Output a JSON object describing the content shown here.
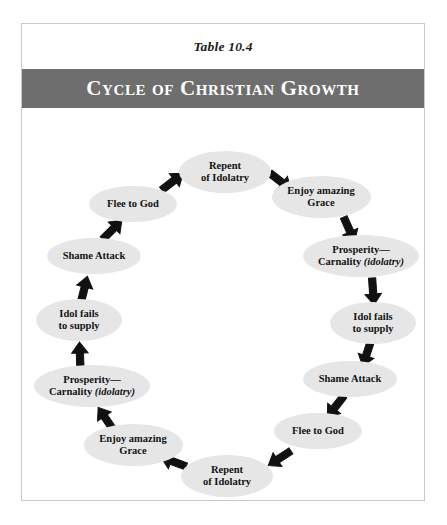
{
  "caption": "Table 10.4",
  "header": {
    "title": "Cycle of Christian Growth",
    "band_color": "#6e6e6e",
    "text_color": "#ffffff"
  },
  "frame": {
    "border_color": "#c9c9c9",
    "background": "#ffffff"
  },
  "diagram": {
    "type": "cycle",
    "direction": "clockwise",
    "node_fill": "#e6e6e6",
    "node_text_color": "#131313",
    "arrow_color": "#111111",
    "node_count": 12,
    "nodes": [
      {
        "id": "repent-of-idolatry-top",
        "line1": "Repent",
        "line2": "of Idolatry",
        "italic_suffix": "",
        "cx": 203,
        "cy": 64,
        "w": 92,
        "h": 42,
        "angle_deg": 270
      },
      {
        "id": "enjoy-amazing-grace-upper-right",
        "line1": "Enjoy amazing",
        "line2": "Grace",
        "italic_suffix": "",
        "cx": 299,
        "cy": 89,
        "w": 99,
        "h": 42,
        "angle_deg": 315
      },
      {
        "id": "prosperity-carnality-right",
        "line1": "Prosperity—",
        "line2": "Carnality ",
        "italic_suffix": "(idolatry)",
        "cx": 339,
        "cy": 148,
        "w": 116,
        "h": 42,
        "angle_deg": 0
      },
      {
        "id": "idol-fails-to-supply-lower-right",
        "line1": "Idol fails",
        "line2": "to supply",
        "italic_suffix": "",
        "cx": 351,
        "cy": 215,
        "w": 86,
        "h": 42,
        "angle_deg": 30
      },
      {
        "id": "shame-attack-lower-right",
        "line1": "Shame Attack",
        "line2": "",
        "italic_suffix": "",
        "cx": 328,
        "cy": 271,
        "w": 94,
        "h": 36,
        "angle_deg": 60
      },
      {
        "id": "flee-to-god-bottom-right",
        "line1": "Flee to God",
        "line2": "",
        "italic_suffix": "",
        "cx": 296,
        "cy": 323,
        "w": 88,
        "h": 36,
        "angle_deg": 80
      },
      {
        "id": "repent-of-idolatry-bottom",
        "line1": "Repent",
        "line2": "of Idolatry",
        "italic_suffix": "",
        "cx": 205,
        "cy": 368,
        "w": 92,
        "h": 42,
        "angle_deg": 95
      },
      {
        "id": "enjoy-amazing-grace-bottom-left",
        "line1": "Enjoy amazing",
        "line2": "Grace",
        "italic_suffix": "",
        "cx": 111,
        "cy": 337,
        "w": 99,
        "h": 42,
        "angle_deg": 125
      },
      {
        "id": "prosperity-carnality-left",
        "line1": "Prosperity—",
        "line2": "Carnality ",
        "italic_suffix": "(idolatry)",
        "cx": 70,
        "cy": 278,
        "w": 116,
        "h": 42,
        "angle_deg": 160
      },
      {
        "id": "idol-fails-to-supply-left",
        "line1": "Idol fails",
        "line2": "to supply",
        "italic_suffix": "",
        "cx": 57,
        "cy": 212,
        "w": 86,
        "h": 42,
        "angle_deg": 195
      },
      {
        "id": "shame-attack-left",
        "line1": "Shame Attack",
        "line2": "",
        "italic_suffix": "",
        "cx": 72,
        "cy": 148,
        "w": 94,
        "h": 36,
        "angle_deg": 225
      },
      {
        "id": "flee-to-god-upper-left",
        "line1": "Flee to God",
        "line2": "",
        "italic_suffix": "",
        "cx": 111,
        "cy": 96,
        "w": 88,
        "h": 36,
        "angle_deg": 250
      }
    ],
    "arrows": [
      {
        "id": "arrow-flee-to-repent-top",
        "x": 150,
        "y": 74,
        "rot": -38
      },
      {
        "id": "arrow-repent-to-enjoy-top",
        "x": 258,
        "y": 73,
        "rot": 38
      },
      {
        "id": "arrow-enjoy-to-prosperity-right",
        "x": 327,
        "y": 121,
        "rot": 66
      },
      {
        "id": "arrow-prosperity-to-idol-right",
        "x": 351,
        "y": 183,
        "rot": 86
      },
      {
        "id": "arrow-idol-to-shame-right",
        "x": 345,
        "y": 245,
        "rot": 108
      },
      {
        "id": "arrow-shame-to-flee-right",
        "x": 314,
        "y": 298,
        "rot": 128
      },
      {
        "id": "arrow-flee-to-repent-bottom",
        "x": 258,
        "y": 350,
        "rot": 147
      },
      {
        "id": "arrow-repent-to-enjoy-bottom",
        "x": 152,
        "y": 354,
        "rot": 200
      },
      {
        "id": "arrow-enjoy-to-prosperity-left",
        "x": 84,
        "y": 311,
        "rot": 236
      },
      {
        "id": "arrow-prosperity-to-idol-left",
        "x": 58,
        "y": 248,
        "rot": 268
      },
      {
        "id": "arrow-idol-to-shame-left",
        "x": 62,
        "y": 182,
        "rot": 284
      },
      {
        "id": "arrow-shame-to-flee-left",
        "x": 90,
        "y": 122,
        "rot": 315
      }
    ]
  }
}
